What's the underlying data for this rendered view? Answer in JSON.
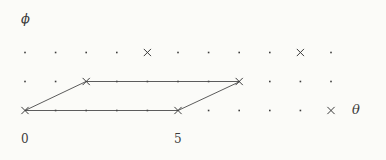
{
  "chart_data": {
    "type": "scatter",
    "title": "",
    "xlabel": "θ",
    "ylabel": "ϕ",
    "grid": false,
    "legend": null,
    "x_ticks": [
      {
        "value": 0,
        "label": "0",
        "px": 25
      },
      {
        "value": 5,
        "label": "5",
        "px": 178
      }
    ],
    "y_ticks": [],
    "lattice": {
      "columns": 11,
      "rows": 3,
      "x_start_px": 25,
      "x_step_px": 30.6,
      "row_y_px": [
        52.5,
        81.5,
        110.5
      ],
      "dot_marker": "dot",
      "cross_marker": "x"
    },
    "marked_points": [
      {
        "col": 4,
        "row": 0,
        "marker": "x"
      },
      {
        "col": 9,
        "row": 0,
        "marker": "x"
      },
      {
        "col": 2,
        "row": 1,
        "marker": "x"
      },
      {
        "col": 7,
        "row": 1,
        "marker": "x"
      },
      {
        "col": 0,
        "row": 2,
        "marker": "x"
      },
      {
        "col": 5,
        "row": 2,
        "marker": "x"
      },
      {
        "col": 10,
        "row": 2,
        "marker": "x"
      }
    ],
    "parallelogram": {
      "vertices_px": [
        [
          25,
          110.5
        ],
        [
          86,
          81.5
        ],
        [
          240,
          81.5
        ],
        [
          178,
          110.5
        ]
      ],
      "closed": true,
      "stroke": "#4a4a4a"
    },
    "colors": {
      "background": "#fbfbf8",
      "marker": "#3c3c3c",
      "line": "#4a4a4a",
      "text": "#3b3b3b"
    }
  },
  "labels": {
    "phi": "ϕ",
    "theta": "θ",
    "tick_zero": "0",
    "tick_five": "5"
  }
}
